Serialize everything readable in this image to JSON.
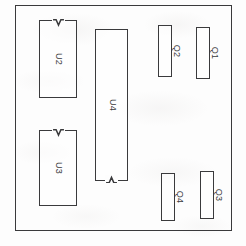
{
  "diagram": {
    "type": "pcb-component-placement-drawing",
    "board": {
      "name": "board-outline",
      "x": 15,
      "y": 5,
      "width": 217,
      "height": 226
    },
    "stroke_color": "#3a3a3c",
    "background_color": "#fdfdfd",
    "components": [
      {
        "ref": "U2",
        "package": "dip-notch-top",
        "x": 39,
        "y": 20,
        "width": 38,
        "height": 78,
        "notch": "top",
        "label_position": "inside"
      },
      {
        "ref": "U3",
        "package": "dip-notch-top",
        "x": 39,
        "y": 130,
        "width": 38,
        "height": 76,
        "notch": "top",
        "label_position": "inside"
      },
      {
        "ref": "U4",
        "package": "dip-notch-bottom",
        "x": 95,
        "y": 29,
        "width": 33,
        "height": 152,
        "notch": "bottom",
        "label_position": "inside"
      },
      {
        "ref": "Q2",
        "package": "to-220",
        "x": 158,
        "y": 25,
        "width": 14,
        "height": 52,
        "notch": "none",
        "label_position": "outside"
      },
      {
        "ref": "Q1",
        "package": "to-220",
        "x": 196,
        "y": 27,
        "width": 14,
        "height": 52,
        "notch": "none",
        "label_position": "outside"
      },
      {
        "ref": "Q4",
        "package": "to-220",
        "x": 161,
        "y": 173,
        "width": 14,
        "height": 48,
        "notch": "none",
        "label_position": "outside"
      },
      {
        "ref": "Q3",
        "package": "to-220",
        "x": 200,
        "y": 171,
        "width": 14,
        "height": 48,
        "notch": "none",
        "label_position": "outside"
      }
    ]
  }
}
